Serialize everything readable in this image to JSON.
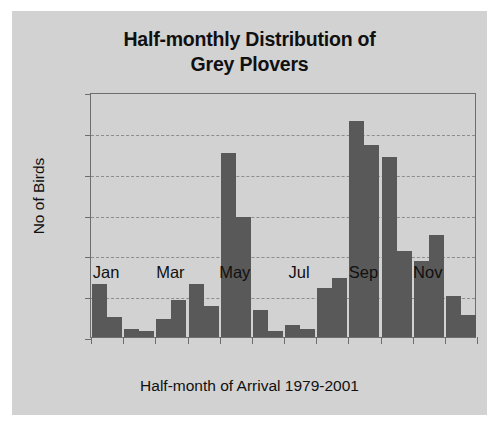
{
  "chart_data": {
    "type": "bar",
    "title": "Half-monthly Distribution of Grey Plovers",
    "title_lines": [
      "Half-monthly Distribution of",
      "Grey Plovers"
    ],
    "xlabel": "Half-month of Arrival 1979-2001",
    "ylabel": "No of Birds",
    "ylim": [
      0,
      120
    ],
    "ytick_values": [
      0,
      20,
      40,
      60,
      80,
      100,
      120
    ],
    "ytick_labels": [
      "0",
      "20",
      "40",
      "60",
      "80",
      "100",
      "120"
    ],
    "xtick_labels": [
      "Jan",
      "Mar",
      "May",
      "Jul",
      "Sep",
      "Nov"
    ],
    "xtick_months": [
      1,
      3,
      5,
      7,
      9,
      11
    ],
    "grid": "horizontal-dashed",
    "legend": "none",
    "categories": [
      "Jan-1",
      "Jan-2",
      "Feb-1",
      "Feb-2",
      "Mar-1",
      "Mar-2",
      "Apr-1",
      "Apr-2",
      "May-1",
      "May-2",
      "Jun-1",
      "Jun-2",
      "Jul-1",
      "Jul-2",
      "Aug-1",
      "Aug-2",
      "Sep-1",
      "Sep-2",
      "Oct-1",
      "Oct-2",
      "Nov-1",
      "Nov-2",
      "Dec-1",
      "Dec-2"
    ],
    "values": [
      26,
      10,
      4,
      3,
      9,
      18,
      26,
      15,
      90,
      59,
      13,
      3,
      6,
      4,
      24,
      29,
      106,
      94,
      88,
      42,
      37,
      50,
      20,
      11
    ],
    "colors": {
      "bar": "#595959",
      "plot_background": "#d2d2d2",
      "page_background": "#ffffff",
      "axis": "#6d6d6d",
      "gridline": "#8d8d8d",
      "text": "#101010"
    }
  }
}
